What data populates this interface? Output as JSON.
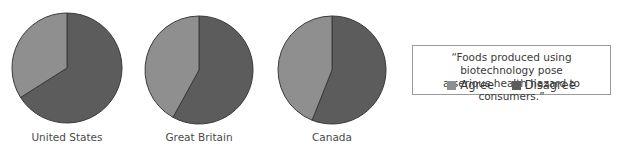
{
  "chart_data": [
    {
      "type": "pie",
      "title": "United States",
      "categories": [
        "Agree",
        "Disagree"
      ],
      "values": [
        34,
        66
      ]
    },
    {
      "type": "pie",
      "title": "Great Britain",
      "categories": [
        "Agree",
        "Disagree"
      ],
      "values": [
        42,
        58
      ]
    },
    {
      "type": "pie",
      "title": "Canada",
      "categories": [
        "Agree",
        "Disagree"
      ],
      "values": [
        44,
        56
      ]
    }
  ],
  "pies": [
    {
      "label": "United States",
      "cx": 67,
      "cy": 68,
      "r": 55,
      "agree": 34
    },
    {
      "label": "Great Britain",
      "cx": 199,
      "cy": 70,
      "r": 54,
      "agree": 42
    },
    {
      "label": "Canada",
      "cx": 332,
      "cy": 70,
      "r": 54,
      "agree": 44
    }
  ],
  "legend": {
    "quote": "“Foods produced using biotechnology pose a serious health hazard to consumers.”",
    "quote_line1": "“Foods produced using biotechnology pose",
    "quote_line2": "a serious health hazard to consumers.”",
    "items": [
      {
        "label": "Agree",
        "color": "#8f8f8f"
      },
      {
        "label": "Disagree",
        "color": "#5c5c5c"
      }
    ]
  },
  "colors": {
    "agree": "#8f8f8f",
    "disagree": "#5c5c5c",
    "outline": "#3a3a3a"
  }
}
